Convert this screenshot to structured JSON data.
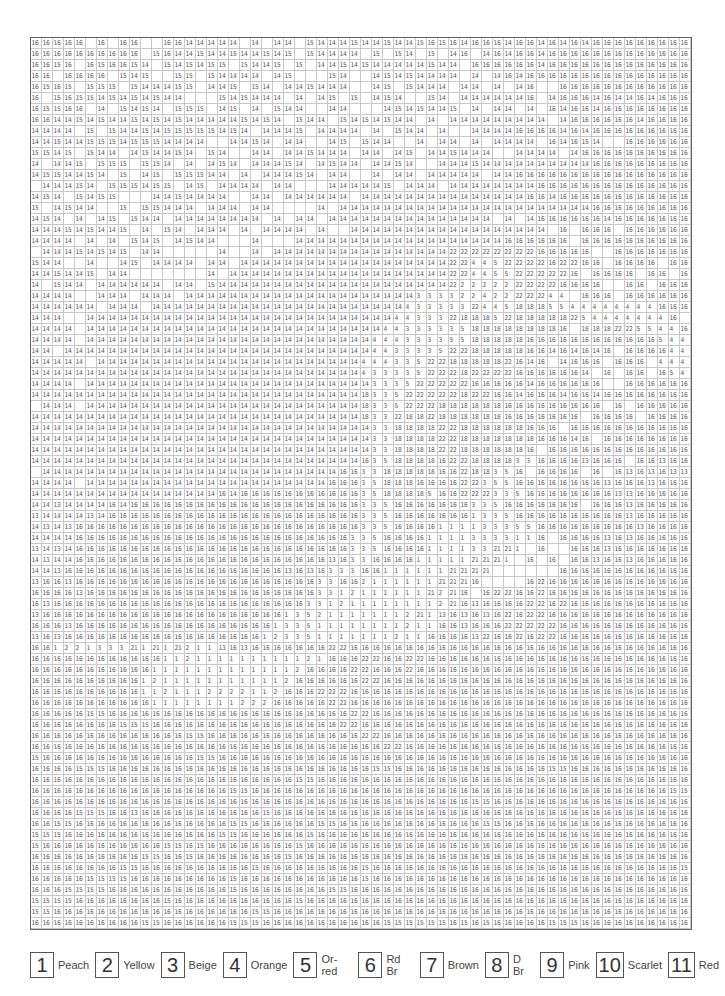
{
  "grid": {
    "columns": 60,
    "rows": [
      "16 16 16 16 16 . 16 . 16 16 . . 16 16 14 14 14 14 14 . 14 . 14 14 . 15 14 14 14 15 14 14 15 14 14 15 16 15 16 14 16 16 16 14 16 16 14 16 14 16 14 16 16 16 16 16 16 16 16 16",
      "16 16 16 16 16 16 16 16 16 16 . 15 16 14 14 15 14 14 15 14 14 15 14 15 . 15 14 14 14 14 . 15 . 15 14 . 15 . 14 16 . 14 16 14 16 16 14 16 16 16 16 16 16 16 16 16 16 16 16 16",
      "16 16 15 16 . 16 15 16 16 15 14 . 15 14 15 14 15 15 . 15 14 14 15 . 15 . 14 14 15 14 15 14 14 14 14 14 15 14 14 . 16 16 16 16 16 16 14 16 16 16 16 16 16 16 16 16 16 16 16 16",
      "16 16 . 16 16 16 16 . 15 14 15 . . 15 15 . 15 14 14 14 14 . 14 15 . . . 15 14 . . 14 15 14 15 14 14 14 14 . 14 . 14 16 14 16 16 16 16 16 16 16 16 16 16 16 16 16 16 16",
      "16 15 16 15 . 15 15 15 . 15 14 14 14 15 15 . 14 14 15 . 15 14 . 14 14 15 14 14 14 . . 14 15 . 15 14 14 14 . 14 14 . 14 . 14 16 . . 16 16 16 16 16 16 16 16 16 16 16 16",
      "16 . 15 16 15 15 14 15 14 15 14 15 14 14 . . . 15 14 15 14 14 14 . 14 . 14 15 . 15 . 14 15 14 . . 15 14 . 14 14 14 14 14 14 16 . 14 16 16 16 14 16 14 14 16 14 16 16 16",
      "16 15 15 16 16 . 14 . 15 14 15 14 . 15 15 15 . 14 15 . 14 . 15 14 14 . . 14 14 . . . 14 15 14 15 14 14 15 . 14 . 14 14 . 14 . 16 14 16 16 14 16 16 16 16 16 16 16 16",
      "16 16 14 14 15 14 15 14 14 15 14 15 14 15 14 14 14 14 14 15 14 15 14 . 15 14 14 . 15 14 15 14 15 14 14 . 14 . 14 14 14 14 14 14 14 14 14 . 14 16 16 16 16 16 16 14 16 16 16 16",
      "14 14 14 14 . 15 . 15 14 14 15 14 15 15 15 15 15 14 15 14 . 14 14 14 15 . 14 14 14 14 . 14 . 15 14 14 . 14 . . 14 14 14 14 16 16 16 16 14 16 14 16 16 16 16 16 16 16 16 16",
      "14 14 15 14 14 15 15 15 14 15 15 15 14 14 14 14 . . 14 14 15 14 . 14 14 . . 14 15 . 15 14 14 . . 14 . 14 14 . 14 . 14 14 14 14 . 16 14 16 15 14 . . 16 16 16 16 16 16",
      "15 15 14 15 . 15 14 14 . 14 15 14 14 15 14 . 15 14 . . 14 14 . 14 14 15 14 14 14 . 14 14 . 14 15 . 14 14 15 14 14 14 . . 14 14 14 14 . 14 16 16 16 16 16 16 16 16 16 16",
      "14 . 14 14 15 . 15 15 15 . 15 15 14 . 14 . 14 15 14 . 14 14 14 15 14 . 14 15 14 14 . 14 14 15 14 . . 14 14 14 15 14 14 14 14 14 14 14 14 14 14 16 16 16 16 16 16 16 16 16",
      "14 15 15 14 14 15 14 . 15 . 14 15 . 15 15 15 14 14 . 14 . 14 14 14 15 14 . 14 14 . . 14 . 14 14 . 14 14 14 14 14 . 14 14 16 16 16 16 16 16 16 16 16 16 16 16 16 16 16 16",
      ". 14 14 14 15 14 . 15 15 15 14 15 15 . 14 15 . 14 14 14 14 . 14 14 . . . 14 14 14 14 14 15 . 14 14 14 . 14 14 14 14 14 14 14 14 16 16 16 16 16 16 16 16 16 16 16 16 16 16",
      "14 15 14 . 15 14 15 15 . . . 14 14 15 14 14 14 14 . . 14 14 . 14 14 14 14 14 14 . 14 14 14 14 14 14 14 14 14 14 14 14 14 14 14 16 16 14 16 16 16 16 16 16 16 16 16 16 16 16",
      "15 . 14 15 14 14 . . 15 . 15 15 14 14 14 . 14 14 14 . 14 14 . . . . 14 . 14 14 14 14 14 14 14 14 14 14 14 14 14 14 14 14 14 14 14 14 14 14 14 16 16 16 16 16 16 16 16 16",
      "14 15 14 . 14 . 14 15 . 15 14 14 . 14 14 14 14 14 14 14 14 . 14 . 14 14 . 14 14 14 14 14 14 14 14 14 14 14 14 14 14 14 . 14 . 14 16 16 16 16 16 16 14 16 16 16 16 16 16 16",
      "14 14 14 15 14 15 14 14 15 . 14 . 15 14 . 14 14 14 . 14 . 14 14 14 14 . 14 . . 14 14 14 14 14 14 14 14 14 14 14 14 14 14 14 14 14 14 . 16 . 16 16 16 . 16 16 16 16 16 16 16",
      "14 14 14 14 . 14 . 14 . 15 14 15 . 14 15 14 14 . . . 14 . . . 14 14 14 14 14 14 14 14 14 14 14 14 14 14 14 14 14 14 14 16 16 16 16 16 16 . 16 16 16 16 16 16 16 16 16 16",
      ". 14 14 14 15 14 15 14 15 . 14 14 . . . . . 14 . . 14 . 14 14 14 14 14 14 14 14 14 14 14 14 14 14 14 14 22 22 22 22 22 22 22 22 16 16 16 16 16 . . 16 16 16 16 16 16 16",
      "15 14 14 . . 14 . . 14 15 . 14 14 14 14 . 14 14 . 14 14 14 14 14 14 14 14 14 14 14 14 14 14 14 14 14 14 14 22 22 4 4 5 22 22 22 22 16 22 22 16 16 . 16 16 16 16 . 16 16",
      "14 14 15 14 14 15 . 14 14 . . . . . . . 14 . 14 14 14 14 14 14 14 14 14 14 14 14 14 14 14 14 14 14 14 14 22 22 4 4 5 5 22 22 22 22 22 16 . 16 16 16 16 . 16 16 . 16 16 16",
      "14 . 15 14 14 . 14 14 14 14 14 14 . 14 14 . 15 14 14 14 14 14 14 14 14 14 14 14 14 14 14 14 14 14 14 14 14 14 22 2 2 2 2 2 22 22 22 22 16 16 16 16 . . 16 16 . 16 16 16",
      "14 14 14 14 . . 14 14 14 . 14 14 14 . 14 14 14 14 14 14 14 14 14 14 14 14 14 14 14 14 14 14 14 14 14 3 3 3 3 2 2 4 2 2 22 22 22 4 4 . 16 16 16 . 16 16 16 16 16 16",
      "14 14 14 14 14 14 . 14 14 14 . 14 14 14 14 14 14 14 14 14 14 14 14 14 14 14 14 14 14 14 14 14 14 14 4 3 3 3 3 3 22 4 4 5 18 18 18 5 5 4 4 4 4 4 4 4 4 16 16 16",
      "14 14 14 . . 14 14 14 14 14 14 14 14 14 14 14 14 14 14 14 14 14 14 14 14 14 14 14 14 14 14 14 14 4 4 3 3 3 22 18 18 18 5 22 18 18 18 18 18 22 5 4 4 4 4 4 4 4 16 .",
      "14 14 14 14 . 14 14 14 14 14 14 14 14 14 14 14 14 14 14 14 14 14 14 14 14 14 14 14 14 14 14 14 4 4 3 3 3 3 3 5 18 18 18 18 18 18 18 18 16 . 18 18 18 22 22 5 5 4 4 16",
      "14 14 14 14 . 14 14 14 14 14 14 14 14 14 14 14 14 14 14 14 14 14 14 14 14 14 14 14 14 14 14 4 4 4 3 3 3 3 5 5 18 18 18 18 18 16 16 16 16 16 16 16 16 16 16 16 16 5 4 4",
      "14 14 . 14 14 14 14 14 14 14 14 14 14 14 14 14 14 14 14 14 14 14 14 14 14 14 14 14 14 14 14 4 4 3 3 3 3 5 22 22 18 18 18 18 18 16 16 14 16 14 16 14 16 . 16 16 16 16 4 4",
      "14 14 14 14 14 . 14 14 14 14 14 14 14 14 14 14 14 14 14 14 14 14 14 14 14 14 14 14 14 14 4 4 4 3 3 5 22 22 18 18 18 18 18 22 16 14 16 . 14 16 16 16 . 16 16 16 . 4 4 4",
      "14 14 14 14 14 14 14 14 14 14 14 14 14 14 14 14 14 14 14 14 14 14 14 14 14 14 14 14 14 14 4 3 3 3 3 5 22 22 22 18 22 22 22 22 16 16 16 16 16 16 14 . 16 . 16 16 . 16 5 4",
      "14 14 14 14 . 14 14 14 14 14 14 14 14 14 14 14 14 14 14 14 14 14 14 14 14 14 14 14 14 14 14 3 3 3 5 22 22 22 22 22 16 16 16 16 16 14 16 16 16 16 16 16 . . 16 16 16 16 16 16",
      "14 14 14 14 14 14 14 14 14 14 14 14 14 14 14 14 14 14 14 14 14 14 14 14 14 14 14 14 14 14 18 3 3 5 22 22 22 22 22 18 22 22 16 16 14 16 16 16 14 16 16 14 16 16 16 16 16 16 16 16",
      ". 14 14 14 . 14 14 14 14 14 14 14 14 14 14 14 14 14 14 14 14 14 14 14 14 14 14 14 14 14 18 3 3 5 22 22 22 18 18 18 18 18 18 16 16 16 16 16 16 16 16 16 . 16 . 16 16 16 16 16",
      "14 14 14 14 14 14 14 14 14 14 14 14 14 14 14 14 14 14 14 14 14 14 14 14 14 14 14 14 14 14 18 3 3 22 18 18 22 18 18 18 18 18 18 16 16 16 16 16 16 16 . 16 16 16 16 . 16 16 16 16",
      "14 14 14 14 14 14 14 14 14 14 14 14 14 14 14 14 14 14 14 14 14 14 14 14 14 14 14 14 14 14 14 3 3 18 18 18 18 22 22 18 18 18 18 18 18 16 16 16 . 16 16 16 16 16 16 16 16 16 16 16",
      "14 14 14 14 14 14 14 14 14 14 14 14 14 14 14 14 14 14 14 14 14 14 14 14 14 14 14 14 14 14 14 3 3 18 18 18 18 22 22 18 18 18 18 18 18 18 16 16 16 14 16 . 16 16 16 16 16 16 16 16",
      "14 14 14 14 14 14 14 14 14 14 14 14 14 14 14 14 14 14 14 14 14 14 14 14 14 14 14 14 14 14 14 3 3 18 18 18 18 22 22 18 18 18 18 18 18 16 . 16 16 16 16 16 16 16 16 16 16 16 16 16",
      "14 14 14 14 14 14 14 14 14 14 14 14 14 14 14 14 14 14 14 14 14 14 14 14 14 14 14 14 14 14 16 3 5 18 18 18 18 16 22 22 18 18 18 18 3 3 16 16 16 16 13 16 16 16 . 16 16 13 16 16",
      ". 14 14 14 14 14 14 14 14 14 14 14 14 14 14 14 14 14 14 14 14 14 14 14 14 14 14 14 16 16 3 3 18 18 18 18 18 16 16 22 18 18 3 5 16 . 16 16 16 16 . 16 . 16 13 16 13 16 13 13",
      "14 14 14 14 . 14 14 14 14 14 14 14 14 14 14 14 14 14 14 14 14 14 14 14 14 14 14 16 16 16 3 5 18 18 18 16 16 16 16 22 22 3 5 5 16 16 16 16 16 16 16 16 13 16 16 16 13 16 16 16",
      "14 14 14 14 14 14 14 14 14 14 14 14 14 14 14 14 14 16 14 16 16 16 16 16 16 16 16 16 16 16 3 5 18 18 18 18 5 16 16 22 22 22 3 3 5 16 16 16 16 16 16 16 16 13 13 16 16 16 16 16",
      "14 14 13 14 14 14 14 16 14 16 16 16 16 16 16 16 16 16 16 16 16 16 16 16 16 16 16 16 16 16 3 3 5 16 16 16 16 16 16 16 3 3 5 16 16 16 16 16 16 16 . 16 16 16 13 16 16 16 16 16",
      "13 14 14 14 14 13 14 16 16 16 16 16 16 16 16 16 16 16 16 16 16 16 16 16 16 16 16 16 16 16 3 3 5 16 16 16 16 16 16 16 1 3 3 5 16 16 16 16 16 16 16 16 16 16 13 16 16 16 16 16",
      "14 13 14 13 16 16 16 16 16 16 16 16 16 16 16 16 16 16 16 16 16 16 16 16 16 16 16 16 16 16 3 3 5 16 16 16 16 1 1 1 1 3 3 3 5 5 16 16 16 16 16 16 16 16 16 13 16 16 16 16",
      "14 14 14 14 16 16 16 16 16 16 16 16 16 16 16 16 16 16 16 16 16 16 16 16 16 16 16 16 16 3 3 5 16 16 16 16 1 1 1 1 3 3 3 3 1 1 16 . 16 16 16 16 13 16 13 16 16 16 16 16",
      "13 14 13 14 16 16 16 16 16 16 16 16 16 16 16 16 16 16 16 16 16 16 16 16 16 16 16 16 16 3 3 5 16 16 16 16 1 1 1 1 3 3 21 21 1 . 16 . . 16 16 16 13 16 16 16 16 16 16 16",
      "14 13 14 14 16 16 16 16 16 16 16 16 16 16 16 16 16 16 16 16 16 16 16 16 16 16 16 13 16 3 3 16 16 16 16 1 1 1 1 1 21 21 21 1 . 16 . 16 . 16 16 13 16 16 13 16 16 16 16 16",
      "14 14 13 16 16 16 16 16 16 16 16 16 16 16 16 16 16 16 16 16 16 16 16 13 16 13 16 3 3 3 16 16 1 1 1 1 1 1 21 21 21 21 . . . . . . 16 16 16 16 16 16 16 16 16 16 16 16",
      "13 16 16 13 16 16 16 16 16 16 16 16 16 16 16 16 16 16 16 16 16 16 16 16 16 16 3 3 16 16 2 1 1 1 1 1 1 21 21 21 16 . . . . 16 22 16 16 16 16 16 16 16 16 16 16 16 16 16",
      "16 16 16 16 13 16 16 16 16 16 16 16 16 16 16 16 16 16 16 16 16 16 16 16 16 16 3 3 1 2 1 1 1 1 1 1 21 2 21 16 . 16 22 22 16 16 22 16 16 16 16 16 16 16 16 16 16 16 16 16",
      "16 13 16 16 16 16 16 16 16 16 16 16 16 16 16 16 16 16 16 16 16 16 16 16 16 3 3 1 2 1 1 1 1 1 1 1 1 2 21 16 13 16 16 16 16 22 22 16 22 16 16 16 16 16 16 16 16 16 16 16",
      "13 16 16 16 16 16 16 16 16 16 16 16 16 16 16 16 16 16 16 16 16 16 16 1 3 5 2 1 1 1 1 1 1 1 2 21 1 13 16 13 16 13 16 22 16 22 22 16 16 16 16 16 16 16 16 16 16 16 16 16",
      "16 16 16 13 16 16 16 16 16 16 16 16 16 16 16 16 16 16 16 16 16 16 1 3 3 5 1 1 1 1 1 1 1 1 2 1 1 16 16 13 16 16 16 22 22 22 22 22 16 16 16 16 16 16 16 16 16 16 16 16",
      "13 16 13 16 16 16 16 16 16 16 16 16 16 16 16 16 16 16 16 16 16 1 2 3 3 5 1 1 1 1 1 1 1 2 1 1 16 16 16 16 13 22 16 16 22 16 22 22 16 16 16 16 16 16 16 16 16 16 16 16",
      "16 16 1 2 2 1 3 3 3 21 1 21 1 21 2 1 1 13 16 13 16 16 16 16 16 16 16 22 22 16 16 16 16 16 16 16 16 16 16 16 16 16 16 16 16 16 16 16 16 16 16 16 16 16 16 16 16 16 16 16",
      "16 16 16 16 16 16 16 16 16 16 16 16 1 1 2 1 1 1 1 1 1 1 1 1 1 2 1 16 16 16 22 22 16 16 22 22 16 16 16 16 16 16 16 16 16 16 16 16 16 16 16 16 16 16 16 16 16 16 16 16",
      "16 16 16 16 16 16 16 16 16 16 16 1 1 1 1 1 1 1 1 1 1 1 1 1 2 16 16 16 16 22 22 16 16 16 22 16 16 16 16 16 16 16 16 16 16 16 16 16 16 16 16 16 16 16 16 16 16 16 16 16",
      "16 16 16 16 16 16 16 16 16 16 1 2 1 1 1 1 1 1 1 1 1 1 1 2 16 16 16 16 16 16 22 22 16 16 16 16 16 16 16 16 16 16 16 16 16 16 16 16 16 16 16 16 16 16 16 16 16 16 16 16",
      "16 16 16 16 16 16 16 16 16 16 1 1 2 1 1 1 2 2 2 2 1 1 2 16 16 16 22 22 22 16 16 16 16 16 16 16 16 16 16 16 16 16 16 16 16 16 16 16 16 16 16 16 16 16 16 16 16 16 16 16",
      "16 16 16 16 16 16 16 16 16 16 16 1 1 1 1 1 1 1 1 2 2 2 16 16 16 16 16 22 22 16 16 16 16 16 16 16 16 16 16 16 16 16 16 16 16 16 16 16 16 16 16 16 16 16 16 16 16 16 16 16",
      "16 16 16 16 16 15 15 16 16 16 16 16 16 16 16 16 16 16 16 16 16 16 16 16 16 16 16 16 16 22 22 16 16 16 16 16 16 16 16 16 16 16 16 16 16 16 16 16 16 16 16 16 16 16 16 16 16 16 16 16",
      "16 16 16 16 16 16 16 16 15 15 15 16 16 16 16 16 16 16 16 16 16 16 16 16 16 16 16 16 22 22 16 16 16 16 16 16 16 16 16 16 16 16 16 16 16 16 16 16 16 16 16 16 16 16 16 16 16 16 16 16",
      "16 16 16 16 16 16 16 16 16 16 16 16 16 16 15 15 16 16 16 16 16 16 16 16 16 16 16 16 16 16 22 22 16 16 16 16 16 16 16 16 16 16 16 16 16 16 16 16 16 16 16 16 16 16 16 16 16 16 16 16",
      "16 16 16 16 16 16 16 16 16 16 16 16 16 16 16 16 16 16 16 16 16 16 16 16 16 16 16 16 16 16 16 16 22 22 16 16 16 16 16 16 16 16 16 16 16 16 16 16 16 16 16 16 16 16 16 16 16 16 16 16",
      "15 16 16 16 16 16 16 16 16 16 16 16 16 16 16 15 15 16 16 16 16 16 16 16 16 16 16 16 16 16 16 16 16 16 16 16 16 16 16 16 16 16 16 16 16 16 16 16 16 16 16 16 16 16 16 16 16 16 16 16",
      "16 16 16 16 15 15 15 16 16 16 16 16 16 16 16 16 16 16 16 16 16 16 16 16 16 16 16 16 16 16 16 15 15 16 16 16 16 16 16 16 16 16 16 16 16 16 16 15 15 16 16 16 16 16 16 16 16 16 16 16",
      "16 16 16 16 16 16 16 16 16 16 16 16 16 16 16 16 16 16 16 16 16 16 16 16 15 15 16 16 16 16 16 16 16 16 16 16 16 16 16 16 16 16 16 16 16 16 16 16 16 16 16 16 16 16 16 16 16 16 16 16",
      "16 16 16 16 16 16 16 16 16 16 16 16 16 16 16 16 16 16 15 15 16 16 16 16 16 16 16 16 16 16 16 16 16 16 16 16 16 16 16 16 16 16 16 16 16 16 16 16 16 16 16 16 16 16 16 16 16 16 15 15",
      "16 16 16 16 16 16 16 16 16 16 16 16 16 16 16 16 16 16 16 16 16 16 16 16 16 16 16 16 16 16 16 16 16 16 16 16 16 16 16 16 15 15 16 16 16 16 16 16 16 16 16 16 16 16 16 16 16 16 16 16",
      "16 16 16 16 15 15 15 16 16 13 16 16 16 16 16 16 16 16 16 16 16 15 16 16 16 16 16 16 16 16 16 16 16 16 16 16 16 16 16 16 16 16 16 16 16 16 16 16 16 16 16 16 16 16 16 16 16 16 16 16",
      "16 16 15 15 16 16 16 16 16 16 16 16 16 16 16 16 16 16 15 15 16 16 16 16 16 16 15 15 16 16 16 16 16 16 16 16 16 16 16 16 16 15 15 16 16 16 16 16 16 16 16 16 16 16 16 16 16 16 16 16",
      "15 15 15 16 16 16 16 16 16 16 16 16 16 16 16 16 16 15 15 16 16 16 16 16 16 15 16 16 16 16 16 16 16 16 16 16 16 16 16 16 16 16 16 16 16 16 16 16 16 16 16 16 16 16 16 16 16 16 16 16",
      "15 16 16 16 16 16 16 16 16 16 16 16 15 15 16 15 16 16 16 16 16 16 16 16 15 16 16 16 16 16 16 16 16 16 16 16 16 16 16 16 16 16 16 16 16 16 16 16 16 16 16 16 16 16 16 16 16 16 16 16",
      "16 16 16 16 16 16 16 16 16 16 15 15 16 16 15 16 16 16 16 16 16 16 16 15 16 16 16 16 16 16 16 16 16 16 16 16 16 16 16 16 16 16 16 16 16 16 16 16 16 16 16 16 16 16 16 16 16 16 16 16",
      "16 16 16 16 16 16 16 16 15 15 16 16 16 16 16 16 16 16 16 16 15 16 16 16 16 16 16 16 16 16 15 16 16 16 16 16 16 16 16 16 16 16 16 16 16 16 16 16 16 16 16 16 16 16 16 16 16 16 16 15",
      "16 16 16 16 16 15 15 15 15 16 16 16 16 16 16 16 16 16 15 16 16 16 16 16 16 16 16 16 16 16 15 16 16 16 16 16 16 16 16 16 16 16 16 16 16 16 16 16 16 16 16 16 16 16 16 16 16 16 16 16",
      "16 16 16 15 15 15 15 16 16 16 16 16 16 16 16 16 16 16 15 16 16 16 16 16 16 16 16 15 15 16 16 16 16 16 16 16 16 16 16 16 16 16 16 16 16 16 16 16 16 16 16 16 16 16 16 16 16 16 16 16",
      "15 15 15 15 16 16 16 16 16 16 16 16 15 16 16 16 16 16 16 16 16 16 16 16 15 16 16 16 16 16 16 16 16 16 16 16 16 16 16 16 16 16 16 16 16 16 16 16 16 16 16 16 16 16 16 16 16 16 16 16",
      "15 15 16 16 16 16 16 16 16 16 16 16 16 16 16 16 16 16 16 16 15 15 16 16 16 16 16 16 16 16 16 16 16 16 16 16 16 16 16 16 16 16 16 16 16 16 16 16 16 16 16 16 16 16 16 16 16 16 16 16",
      "16 16 16 16 16 16 16 16 16 16 15 15 16 16 16 16 16 16 15 15 15 16 16 16 16 16 16 16 16 16 16 16 15 15 15 15 15 15 16 15 16 15 16 16 16 16 16 15 15 15 16 16 16 16 16 16 16 16 16 16"
    ]
  },
  "legend": [
    {
      "num": "1",
      "label": "Peach"
    },
    {
      "num": "2",
      "label": "Yellow"
    },
    {
      "num": "3",
      "label": "Beige"
    },
    {
      "num": "4",
      "label": "Orange"
    },
    {
      "num": "5",
      "label": "Or-red"
    },
    {
      "num": "6",
      "label": "Rd Br"
    },
    {
      "num": "7",
      "label": "Brown"
    },
    {
      "num": "8",
      "label": "D Br"
    },
    {
      "num": "9",
      "label": "Pink"
    },
    {
      "num": "10",
      "label": "Scarlet"
    },
    {
      "num": "11",
      "label": "Red"
    }
  ]
}
